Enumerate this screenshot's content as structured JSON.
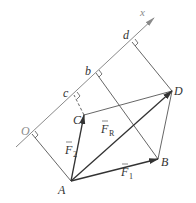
{
  "figure": {
    "type": "vector projection diagram",
    "axis": {
      "label": "x",
      "start": [
        16,
        147
      ],
      "end": [
        154,
        18
      ],
      "color": "#8a8a8a"
    },
    "points": {
      "A": {
        "label": "A",
        "pos": [
          71,
          181
        ]
      },
      "B": {
        "label": "B",
        "pos": [
          158,
          159
        ]
      },
      "C": {
        "label": "C",
        "pos": [
          84,
          115
        ]
      },
      "D": {
        "label": "D",
        "pos": [
          172,
          91
        ]
      }
    },
    "projections": {
      "O": {
        "label": "O",
        "pos": [
          32,
          134
        ],
        "from": "A"
      },
      "c": {
        "label": "c",
        "pos": [
          74,
          95
        ],
        "from": "C",
        "dashed": true
      },
      "b": {
        "label": "b",
        "pos": [
          96,
          73
        ],
        "from": "B"
      },
      "d": {
        "label": "d",
        "pos": [
          132,
          42
        ],
        "from": "D"
      }
    },
    "vectors": {
      "F1": {
        "label": "F",
        "sub": "1",
        "from": "A",
        "to": "B"
      },
      "F2": {
        "label": "F",
        "sub": "2",
        "from": "A",
        "to": "C"
      },
      "FR": {
        "label": "F",
        "sub": "R",
        "from": "A",
        "to": "D"
      }
    },
    "colors": {
      "line": "#555555",
      "vector": "#333333",
      "axis": "#8a8a8a"
    }
  }
}
